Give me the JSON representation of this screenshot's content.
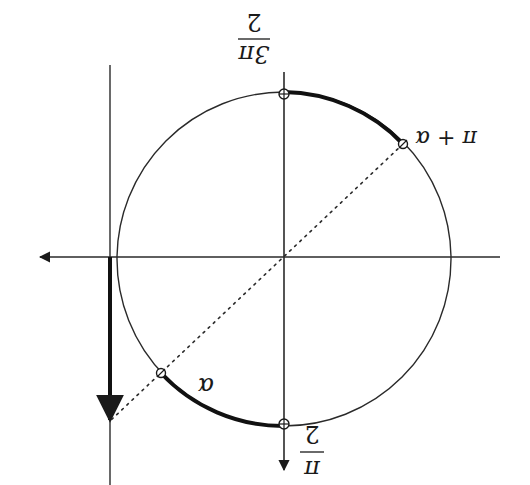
{
  "diagram": {
    "orientation": "rotated 180 degrees",
    "colors": {
      "stroke": "#2a2a2a",
      "thick": "#111111",
      "background": "#ffffff"
    },
    "labels": {
      "top_fraction_numerator": "3π",
      "top_fraction_denominator": "2",
      "bottom_fraction_numerator": "π",
      "bottom_fraction_denominator": "2",
      "point_pi_plus_alpha": "π + α",
      "arc_alpha": "α"
    },
    "points": [
      {
        "name": "three-pi-over-two",
        "x": 284,
        "y": 95
      },
      {
        "name": "pi-over-two",
        "x": 284,
        "y": 424
      },
      {
        "name": "pi-plus-alpha",
        "x": 403,
        "y": 144
      },
      {
        "name": "alpha",
        "x": 161,
        "y": 373
      }
    ],
    "circle": {
      "cx": 284,
      "cy": 259,
      "r": 167
    }
  }
}
